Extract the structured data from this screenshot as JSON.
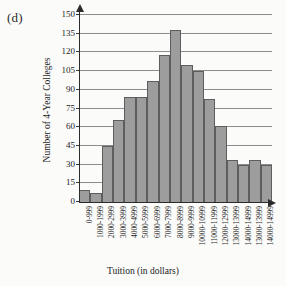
{
  "panel": {
    "label": "(d)"
  },
  "chart_data": {
    "type": "bar",
    "title": "",
    "xlabel": "Tuition (in dollars)",
    "ylabel": "Number of 4-Year Colleges",
    "ylim": [
      0,
      150
    ],
    "yticks": [
      0,
      15,
      30,
      45,
      60,
      75,
      90,
      105,
      120,
      135,
      150
    ],
    "grid": true,
    "legend": "none",
    "categories": [
      "0-999",
      "1000-1999",
      "2000-2999",
      "3000-3999",
      "4000-4999",
      "5000-5999",
      "6000-6999",
      "7000-7999",
      "8000-8999",
      "9000-9999",
      "10000-10999",
      "11000-11999",
      "12000-12999",
      "13000-13999",
      "14000-14999",
      "13000-13999",
      "14000-14999"
    ],
    "values": [
      10,
      7,
      45,
      66,
      84,
      84,
      97,
      118,
      138,
      110,
      105,
      83,
      61,
      34,
      30,
      34,
      30
    ],
    "bar_color": "#9d9d9d",
    "bar_edge_color": "#5d5d5d",
    "axis_color": "#2b2b2b",
    "grid_color": "#8d8d8d"
  }
}
